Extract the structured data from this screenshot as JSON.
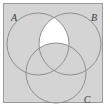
{
  "figure": {
    "sets": [
      {
        "id": "A",
        "label": "A",
        "label_x": 12,
        "label_y": 18,
        "cx": 38,
        "cy": 44,
        "r": 31
      },
      {
        "id": "B",
        "label": "B",
        "label_x": 95,
        "label_y": 18,
        "cx": 70,
        "cy": 44,
        "r": 31
      },
      {
        "id": "C",
        "label": "C",
        "label_x": 86,
        "label_y": 100,
        "cx": 56,
        "cy": 73,
        "r": 30
      }
    ],
    "highlighted_region": {
      "expression": "(A n B) \\ C",
      "fill": "#ffffff"
    },
    "colors": {
      "page_background": "#ffffff",
      "panel_fill": "#d4d4d4",
      "panel_border": "#9a9a9a",
      "circle_stroke": "#8f8f8f",
      "label_text": "#3a3a3a",
      "highlight_fill": "#ffffff"
    },
    "panel": {
      "x": 3,
      "y": 3,
      "width": 99,
      "height": 100
    }
  }
}
